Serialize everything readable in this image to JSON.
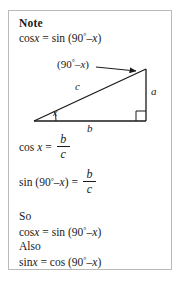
{
  "note": {
    "heading": "Note",
    "intro_identity": {
      "lhs_func": "cos",
      "lhs_var": "x",
      "equals": "=",
      "rhs_func": "sin",
      "rhs_open": "(90",
      "rhs_deg": "°",
      "rhs_minus": "–",
      "rhs_var": "x",
      "rhs_close": ")"
    }
  },
  "figure": {
    "name": "right-triangle",
    "angle_label": {
      "open": "(90",
      "degree": "°",
      "minus": "–",
      "var": "x",
      "close": ")"
    },
    "side_hypotenuse": "c",
    "side_vertical": "a",
    "side_base": "b",
    "angle_at_vertex": "x",
    "stroke_color": "#1a1a1a",
    "vertices": {
      "left": [
        25,
        72
      ],
      "apex": [
        137,
        20
      ],
      "right_angle": [
        137,
        72
      ]
    }
  },
  "equations": [
    {
      "name": "cos-x-equals-b-over-c",
      "func": "cos",
      "arg": "x",
      "equals": "=",
      "numerator": "b",
      "denominator": "c"
    },
    {
      "name": "sin-90-minus-x-equals-b-over-c",
      "func": "sin",
      "arg_open": "(90",
      "arg_deg": "°",
      "arg_minus": "–",
      "arg_var": "x",
      "arg_close": ")",
      "equals": "=",
      "numerator": "b",
      "denominator": "c"
    }
  ],
  "conclusion": {
    "so_label": "So",
    "so_identity": {
      "lhs_func": "cos",
      "lhs_var": "x",
      "equals": "=",
      "rhs_func": "sin",
      "rhs_open": "(90",
      "rhs_deg": "°",
      "rhs_minus": "–",
      "rhs_var": "x",
      "rhs_close": ")"
    },
    "also_label": "Also",
    "also_identity": {
      "lhs_func": "sin",
      "lhs_var": "x",
      "equals": "=",
      "rhs_func": "cos",
      "rhs_open": "(90",
      "rhs_deg": "°",
      "rhs_minus": "–",
      "rhs_var": "x",
      "rhs_close": ")"
    }
  },
  "colors": {
    "border": "#b9b9b9",
    "ink": "#1a1a1a",
    "background": "#ffffff"
  }
}
